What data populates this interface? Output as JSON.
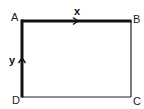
{
  "diagram": {
    "title": "",
    "vertices": [
      {
        "id": "A",
        "label": "A",
        "x": 22,
        "y": 21
      },
      {
        "id": "B",
        "label": "B",
        "x": 131,
        "y": 21
      },
      {
        "id": "C",
        "label": "C",
        "x": 131,
        "y": 97
      },
      {
        "id": "D",
        "label": "D",
        "x": 22,
        "y": 97
      }
    ],
    "edges": [
      {
        "from": "A",
        "to": "B",
        "thick": true,
        "arrow": true,
        "label": "x"
      },
      {
        "from": "B",
        "to": "C",
        "thick": false,
        "arrow": false,
        "label": ""
      },
      {
        "from": "C",
        "to": "D",
        "thick": false,
        "arrow": false,
        "label": ""
      },
      {
        "from": "D",
        "to": "A",
        "thick": true,
        "arrow": true,
        "label": "y"
      }
    ],
    "labels": {
      "A": "A",
      "B": "B",
      "C": "C",
      "D": "D",
      "x": "x",
      "y": "y"
    },
    "colors": {
      "line": "#111111",
      "background": "#ffffff"
    }
  }
}
